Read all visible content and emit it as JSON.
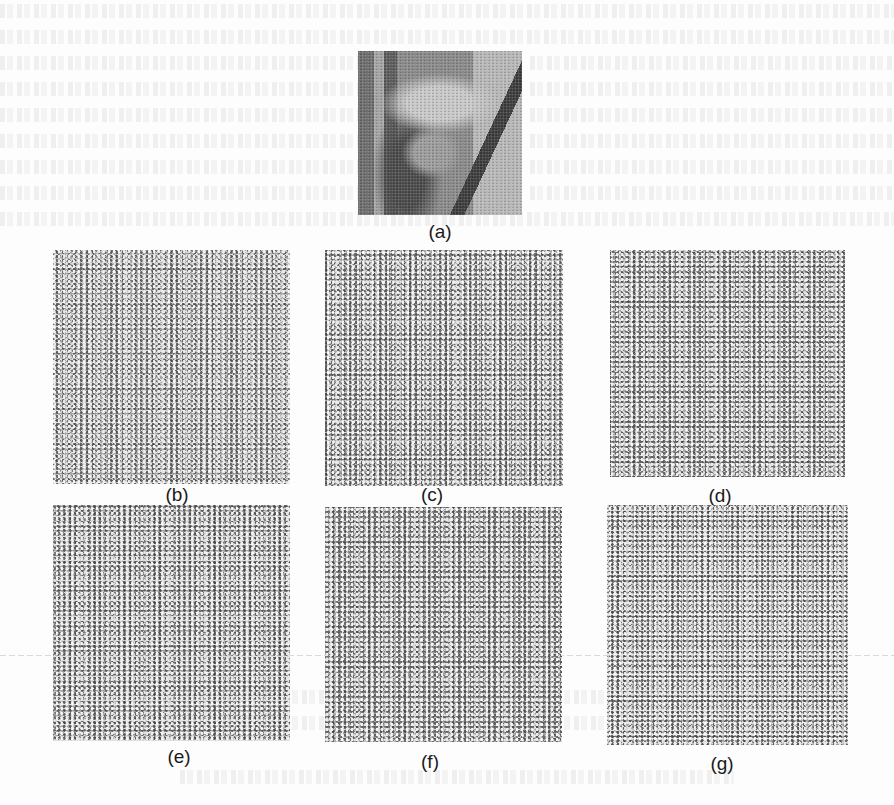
{
  "figure": {
    "panels": [
      {
        "id": "a",
        "label": "(a)",
        "kind": "original-grayscale-photo",
        "description": "portrait with hat"
      },
      {
        "id": "b",
        "label": "(b)",
        "kind": "noise-like-image"
      },
      {
        "id": "c",
        "label": "(c)",
        "kind": "noise-like-image"
      },
      {
        "id": "d",
        "label": "(d)",
        "kind": "noise-like-image"
      },
      {
        "id": "e",
        "label": "(e)",
        "kind": "noise-like-image"
      },
      {
        "id": "f",
        "label": "(f)",
        "kind": "noise-like-image"
      },
      {
        "id": "g",
        "label": "(g)",
        "kind": "noise-like-image"
      }
    ]
  },
  "colors": {
    "page_background": "#fdfdfd",
    "label_text": "#1a1a1a",
    "noise_mid_gray": "#a4a4a4"
  }
}
